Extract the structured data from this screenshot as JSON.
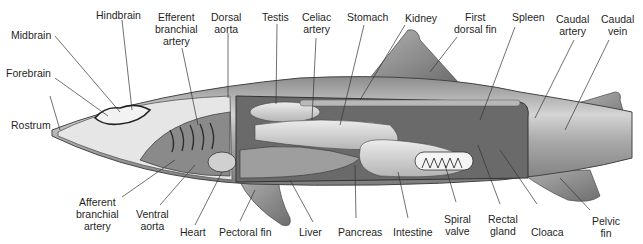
{
  "labels": {
    "hindbrain": "Hindbrain",
    "midbrain": "Midbrain",
    "forebrain": "Forebrain",
    "rostrum": "Rostrum",
    "efferent_branchial_artery": "Efferent\nbranchial\nartery",
    "dorsal_aorta": "Dorsal\naorta",
    "testis": "Testis",
    "celiac_artery": "Celiac\nartery",
    "stomach": "Stomach",
    "kidney": "Kidney",
    "first_dorsal_fin": "First\ndorsal fin",
    "spleen": "Spleen",
    "caudal_artery": "Caudal\nartery",
    "caudal_vein": "Caudal\nvein",
    "afferent_branchial_artery": "Afferent\nbranchial\nartery",
    "ventral_aorta": "Ventral\naorta",
    "heart": "Heart",
    "pectoral_fin": "Pectoral fin",
    "liver": "Liver",
    "pancreas": "Pancreas",
    "intestine": "Intestine",
    "spiral_valve": "Spiral\nvalve",
    "rectal_gland": "Rectal\ngland",
    "cloaca": "Cloaca",
    "pelvic_fin": "Pelvic\nfin"
  },
  "colors": {
    "body": "#9a9a9a",
    "body_light": "#c8c8c8",
    "organ": "#d9d9d9",
    "cavity": "#7a7a7a",
    "outline": "#3a3a3a",
    "leader": "#333333"
  }
}
